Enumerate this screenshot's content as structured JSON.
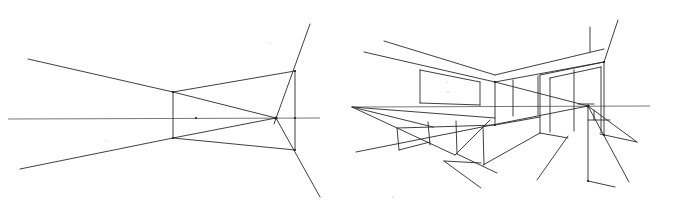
{
  "figure": {
    "stroke_color": "#2a2a2a",
    "background": "#ffffff"
  },
  "left_sketch": {
    "name": "one-point perspective frame construction",
    "horizon": [
      [
        8,
        119
      ],
      [
        320,
        118
      ]
    ],
    "vanishing_point": [
      276,
      118
    ],
    "lines": [
      [
        [
          28,
          59
        ],
        [
          173,
          92
        ]
      ],
      [
        [
          173,
          92
        ],
        [
          276,
          118
        ]
      ],
      [
        [
          20,
          169
        ],
        [
          173,
          138
        ]
      ],
      [
        [
          173,
          138
        ],
        [
          276,
          118
        ]
      ],
      [
        [
          173,
          92
        ],
        [
          173,
          138
        ]
      ],
      [
        [
          173,
          92
        ],
        [
          295,
          71
        ]
      ],
      [
        [
          173,
          138
        ],
        [
          295,
          150
        ]
      ],
      [
        [
          295,
          71
        ],
        [
          295,
          150
        ]
      ],
      [
        [
          274,
          124
        ],
        [
          310,
          24
        ]
      ],
      [
        [
          276,
          118
        ],
        [
          320,
          197
        ]
      ]
    ],
    "points": [
      [
        173,
        92
      ],
      [
        173,
        138
      ],
      [
        295,
        71
      ],
      [
        295,
        150
      ],
      [
        276,
        118
      ],
      [
        196,
        118
      ],
      [
        295,
        118
      ]
    ]
  },
  "right_sketch": {
    "name": "interior room perspective with boxes and window",
    "horizon": [
      [
        352,
        107
      ],
      [
        650,
        106
      ]
    ],
    "vanishing_point": [
      588,
      106
    ],
    "lines": [
      [
        [
          384,
          41
        ],
        [
          495,
          75
        ]
      ],
      [
        [
          364,
          52
        ],
        [
          495,
          82
        ]
      ],
      [
        [
          495,
          75
        ],
        [
          604,
          49
        ]
      ],
      [
        [
          495,
          82
        ],
        [
          604,
          62
        ]
      ],
      [
        [
          590,
          27
        ],
        [
          590,
          52
        ]
      ],
      [
        [
          604,
          62
        ],
        [
          618,
          20
        ]
      ],
      [
        [
          495,
          82
        ],
        [
          588,
          106
        ]
      ],
      [
        [
          420,
          70
        ],
        [
          480,
          82
        ]
      ],
      [
        [
          420,
          70
        ],
        [
          420,
          103
        ]
      ],
      [
        [
          420,
          103
        ],
        [
          480,
          105
        ]
      ],
      [
        [
          480,
          82
        ],
        [
          480,
          105
        ]
      ],
      [
        [
          495,
          82
        ],
        [
          495,
          125
        ]
      ],
      [
        [
          513,
          80
        ],
        [
          513,
          116
        ]
      ],
      [
        [
          538,
          76
        ],
        [
          538,
          115
        ]
      ],
      [
        [
          540,
          75
        ],
        [
          540,
          133
        ]
      ],
      [
        [
          550,
          78
        ],
        [
          550,
          132
        ]
      ],
      [
        [
          574,
          70
        ],
        [
          574,
          131
        ]
      ],
      [
        [
          601,
          67
        ],
        [
          601,
          133
        ]
      ],
      [
        [
          604,
          62
        ],
        [
          604,
          135
        ]
      ],
      [
        [
          540,
          75
        ],
        [
          604,
          62
        ]
      ],
      [
        [
          550,
          78
        ],
        [
          601,
          67
        ]
      ],
      [
        [
          352,
          107
        ],
        [
          495,
          118
        ]
      ],
      [
        [
          352,
          107
        ],
        [
          433,
          127
        ]
      ],
      [
        [
          352,
          107
        ],
        [
          455,
          155
        ]
      ],
      [
        [
          356,
          152
        ],
        [
          588,
          106
        ]
      ],
      [
        [
          455,
          155
        ],
        [
          490,
          120
        ]
      ],
      [
        [
          495,
          125
        ],
        [
          540,
          117
        ]
      ],
      [
        [
          433,
          127
        ],
        [
          495,
          125
        ]
      ],
      [
        [
          397,
          128
        ],
        [
          433,
          127
        ]
      ],
      [
        [
          397,
          128
        ],
        [
          399,
          150
        ]
      ],
      [
        [
          428,
          122
        ],
        [
          430,
          145
        ]
      ],
      [
        [
          456,
          121
        ],
        [
          457,
          154
        ]
      ],
      [
        [
          483,
          126
        ],
        [
          484,
          165
        ]
      ],
      [
        [
          483,
          165
        ],
        [
          540,
          133
        ]
      ],
      [
        [
          399,
          150
        ],
        [
          430,
          142
        ]
      ],
      [
        [
          457,
          154
        ],
        [
          497,
          173
        ]
      ],
      [
        [
          444,
          161
        ],
        [
          481,
          163
        ]
      ],
      [
        [
          444,
          161
        ],
        [
          481,
          188
        ]
      ],
      [
        [
          540,
          133
        ],
        [
          568,
          138
        ]
      ],
      [
        [
          568,
          136
        ],
        [
          537,
          180
        ]
      ],
      [
        [
          588,
          106
        ],
        [
          588,
          181
        ]
      ],
      [
        [
          588,
          181
        ],
        [
          615,
          187
        ]
      ],
      [
        [
          588,
          106
        ],
        [
          629,
          182
        ]
      ],
      [
        [
          588,
          106
        ],
        [
          637,
          142
        ]
      ],
      [
        [
          588,
          120
        ],
        [
          610,
          120
        ]
      ],
      [
        [
          600,
          134
        ],
        [
          637,
          142
        ]
      ],
      [
        [
          594,
          110
        ],
        [
          594,
          120
        ]
      ],
      [
        [
          578,
          104
        ],
        [
          594,
          104
        ]
      ]
    ],
    "points": [
      [
        588,
        106
      ],
      [
        604,
        62
      ],
      [
        495,
        82
      ],
      [
        495,
        125
      ],
      [
        588,
        181
      ],
      [
        604,
        135
      ]
    ]
  }
}
